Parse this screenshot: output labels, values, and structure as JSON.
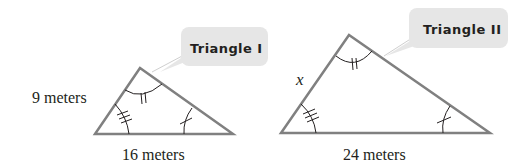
{
  "figure": {
    "triangle_1": {
      "callout": "Triangle I",
      "left_side_label": "9 meters",
      "base_label": "16 meters",
      "angle_marks": {
        "top": 2,
        "bottom_left": 3,
        "bottom_right": 1
      }
    },
    "triangle_2": {
      "callout": "Triangle II",
      "left_side_label": "x",
      "base_label": "24 meters",
      "angle_marks": {
        "top": 2,
        "bottom_left": 3,
        "bottom_right": 1
      }
    },
    "colors": {
      "stroke": "#808080",
      "text": "#231f20",
      "callout_fill": "#e6e6e6"
    }
  }
}
